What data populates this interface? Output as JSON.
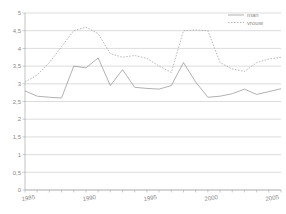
{
  "chart_data": {
    "type": "line",
    "title": "",
    "xlabel": "",
    "ylabel": "",
    "xlim": [
      1985,
      2006
    ],
    "ylim": [
      0,
      5
    ],
    "grid": true,
    "legend_position": "top-right",
    "y_ticks": [
      "0",
      "0,5",
      "1",
      "1,5",
      "2",
      "2,5",
      "3",
      "3,5",
      "4",
      "4,5",
      "5"
    ],
    "y_tick_values": [
      0,
      0.5,
      1,
      1.5,
      2,
      2.5,
      3,
      3.5,
      4,
      4.5,
      5
    ],
    "x_ticks": [
      "1985",
      "1990",
      "1995",
      "2000",
      "2005"
    ],
    "x_tick_values": [
      1985,
      1990,
      1995,
      2000,
      2005
    ],
    "x": [
      1985,
      1986,
      1987,
      1988,
      1989,
      1990,
      1991,
      1992,
      1993,
      1994,
      1995,
      1996,
      1997,
      1998,
      1999,
      2000,
      2001,
      2002,
      2003,
      2004,
      2005,
      2006
    ],
    "series": [
      {
        "name": "man",
        "style": "solid",
        "color": "#8f8f8f",
        "values": [
          2.8,
          2.65,
          2.62,
          2.6,
          3.5,
          3.45,
          3.73,
          2.95,
          3.4,
          2.9,
          2.87,
          2.85,
          2.95,
          3.6,
          3.05,
          2.62,
          2.65,
          2.72,
          2.85,
          2.7,
          2.78,
          2.86
        ]
      },
      {
        "name": "vrouw",
        "style": "dashed",
        "color": "#a8a8a8",
        "values": [
          3.05,
          3.25,
          3.6,
          4.05,
          4.5,
          4.6,
          4.42,
          3.85,
          3.75,
          3.8,
          3.72,
          3.5,
          3.32,
          4.5,
          4.52,
          4.5,
          3.6,
          3.42,
          3.35,
          3.6,
          3.7,
          3.75
        ]
      }
    ]
  }
}
